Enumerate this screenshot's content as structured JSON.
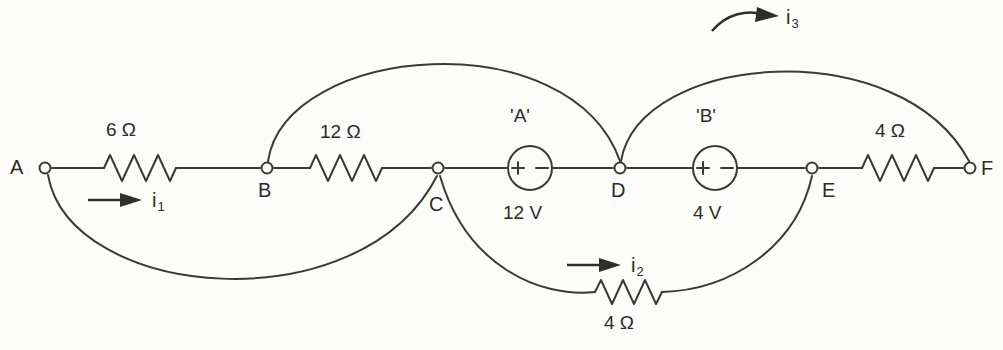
{
  "diagram": {
    "line_color": "#3a3a3a",
    "background_color": "#fdfdfb"
  },
  "nodes": [
    {
      "id": "A",
      "label": "A",
      "x": 45,
      "y": 168
    },
    {
      "id": "B",
      "label": "B",
      "x": 267,
      "y": 168
    },
    {
      "id": "C",
      "label": "C",
      "x": 438,
      "y": 168
    },
    {
      "id": "D",
      "label": "D",
      "x": 620,
      "y": 168
    },
    {
      "id": "E",
      "label": "E",
      "x": 812,
      "y": 168
    },
    {
      "id": "F",
      "label": "F",
      "x": 970,
      "y": 168
    }
  ],
  "resistors": [
    {
      "id": "R_AB",
      "label": "6 Ω",
      "between": "A-B",
      "x": 140,
      "y": 168
    },
    {
      "id": "R_BC",
      "label": "12 Ω",
      "between": "B-C",
      "x": 348,
      "y": 168
    },
    {
      "id": "R_EF",
      "label": "4 Ω",
      "between": "E-F",
      "x": 900,
      "y": 168
    },
    {
      "id": "R_CE",
      "label": "4 Ω",
      "between": "C-E",
      "x": 630,
      "y": 294
    }
  ],
  "sources": [
    {
      "id": "A",
      "name": "'A'",
      "voltage": "12 V",
      "plus": "+",
      "minus": "−",
      "x": 530,
      "y": 168
    },
    {
      "id": "B",
      "name": "'B'",
      "voltage": "4 V",
      "plus": "+",
      "minus": "−",
      "x": 715,
      "y": 168
    }
  ],
  "currents": [
    {
      "id": "i1",
      "label": "i",
      "subscript": "1",
      "branch": "A-B",
      "style": "straight"
    },
    {
      "id": "i2",
      "label": "i",
      "subscript": "2",
      "branch": "C-E",
      "style": "straight"
    },
    {
      "id": "i3",
      "label": "i",
      "subscript": "3",
      "branch": "D-F",
      "style": "curved"
    }
  ],
  "branches": [
    {
      "id": "main",
      "path": "A-B-C-D-E-F",
      "type": "horizontal"
    },
    {
      "id": "arc_AC",
      "path": "A-C",
      "type": "arc-below"
    },
    {
      "id": "arc_BD",
      "path": "B-D",
      "type": "arc-above"
    },
    {
      "id": "arc_CE",
      "path": "C-E",
      "type": "arc-below"
    },
    {
      "id": "arc_DF",
      "path": "D-F",
      "type": "arc-above"
    }
  ]
}
